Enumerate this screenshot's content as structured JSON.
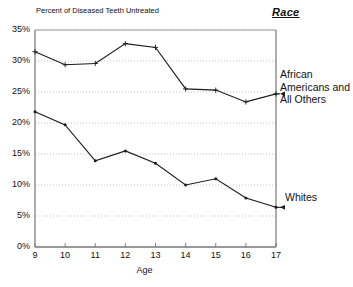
{
  "chart_data": {
    "type": "line",
    "title": "Percent of Diseased Teeth Untreated",
    "xlabel": "Age",
    "ylabel": "",
    "x": [
      9,
      10,
      11,
      12,
      13,
      14,
      15,
      16,
      17
    ],
    "xticklabels": [
      "9",
      "10",
      "11",
      "12",
      "13",
      "14",
      "15",
      "16",
      "17"
    ],
    "yticklabels": [
      "0%",
      "5%",
      "10%",
      "15%",
      "20%",
      "25%",
      "30%",
      "35%"
    ],
    "ytickvalues": [
      0,
      5,
      10,
      15,
      20,
      25,
      30,
      35
    ],
    "xlim": [
      9,
      17
    ],
    "ylim": [
      0,
      35
    ],
    "grid": "horizontal-dotted",
    "legend_position": "right-inline",
    "legend_title": "Race",
    "series": [
      {
        "name": "African Americans and All Others",
        "label_lines": [
          "African",
          "Americans and",
          "All Others"
        ],
        "values": [
          31.5,
          29.4,
          29.6,
          32.8,
          32.2,
          25.5,
          25.3,
          23.4,
          24.7
        ],
        "marker": "plus"
      },
      {
        "name": "Whites",
        "label_lines": [
          "Whites"
        ],
        "values": [
          21.8,
          19.7,
          13.9,
          15.5,
          13.5,
          10.0,
          11.0,
          7.9,
          6.4
        ],
        "marker": "dot"
      }
    ]
  },
  "annotations": {
    "race_heading": "Race",
    "edge_fragment": ""
  }
}
